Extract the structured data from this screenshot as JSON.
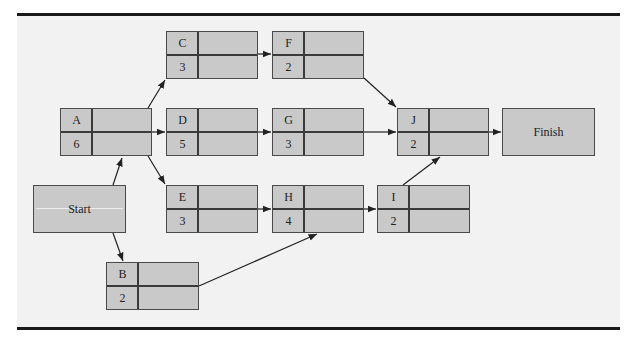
{
  "figure": {
    "title_fragment": "",
    "type": "activity-on-node project network"
  },
  "nodes": {
    "start": {
      "label": "Start"
    },
    "finish": {
      "label": "Finish"
    },
    "A": {
      "id": "A",
      "duration": "6"
    },
    "B": {
      "id": "B",
      "duration": "2"
    },
    "C": {
      "id": "C",
      "duration": "3"
    },
    "D": {
      "id": "D",
      "duration": "5"
    },
    "E": {
      "id": "E",
      "duration": "3"
    },
    "F": {
      "id": "F",
      "duration": "2"
    },
    "G": {
      "id": "G",
      "duration": "3"
    },
    "H": {
      "id": "H",
      "duration": "4"
    },
    "I": {
      "id": "I",
      "duration": "2"
    },
    "J": {
      "id": "J",
      "duration": "2"
    }
  },
  "edges": [
    [
      "Start",
      "A"
    ],
    [
      "Start",
      "B"
    ],
    [
      "A",
      "C"
    ],
    [
      "A",
      "D"
    ],
    [
      "A",
      "E"
    ],
    [
      "B",
      "H"
    ],
    [
      "C",
      "F"
    ],
    [
      "D",
      "G"
    ],
    [
      "E",
      "H"
    ],
    [
      "F",
      "J"
    ],
    [
      "G",
      "J"
    ],
    [
      "H",
      "I"
    ],
    [
      "I",
      "J"
    ],
    [
      "J",
      "Finish"
    ]
  ],
  "colors": {
    "node_fill": "#c9c9c9",
    "node_border": "#4a4a4a",
    "panel": "#f2f2f2",
    "rule": "#1a1a1a"
  }
}
